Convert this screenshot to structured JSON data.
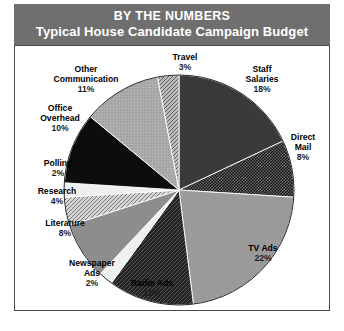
{
  "header": {
    "title_main": "BY THE NUMBERS",
    "title_sub": "Typical House Candidate Campaign Budget",
    "band_color": "#6f6f6f",
    "text_color": "#ffffff"
  },
  "chart_data": {
    "type": "pie",
    "title": "Typical House Candidate Campaign Budget",
    "subtitle": "BY THE NUMBERS",
    "xlabel": "",
    "ylabel": "",
    "legend_position": "none",
    "grid": false,
    "start_angle_deg": 0,
    "direction": "clockwise",
    "unit": "%",
    "categories": [
      "Staff Salaries",
      "Direct Mail",
      "TV Ads",
      "Radio Ads",
      "Newspaper Ads",
      "Literature",
      "Research",
      "Polling",
      "Office Overhead",
      "Other Communication",
      "Travel"
    ],
    "values": [
      18,
      8,
      22,
      12,
      2,
      8,
      4,
      2,
      10,
      11,
      3
    ],
    "slices": [
      {
        "label": "Staff Salaries",
        "label_line1": "Staff",
        "label_line2": "Salaries",
        "value": 18,
        "pct": "18%",
        "fill": "#3a3a3a",
        "pattern": "solid"
      },
      {
        "label": "Direct Mail",
        "label_line1": "Direct",
        "label_line2": "Mail",
        "value": 8,
        "pct": "8%",
        "fill": "#161616",
        "pattern": "checker"
      },
      {
        "label": "TV Ads",
        "label_line1": "TV Ads",
        "label_line2": "",
        "value": 22,
        "pct": "22%",
        "fill": "#9a9a9a",
        "pattern": "solid"
      },
      {
        "label": "Radio Ads",
        "label_line1": "Radio Ads",
        "label_line2": "",
        "value": 12,
        "pct": "12%",
        "fill": "#2b2b2b",
        "pattern": "crosshatch"
      },
      {
        "label": "Newspaper Ads",
        "label_line1": "Newspaper",
        "label_line2": "Ads",
        "value": 2,
        "pct": "2%",
        "fill": "#f0f0f0",
        "pattern": "solid"
      },
      {
        "label": "Literature",
        "label_line1": "Literature",
        "label_line2": "",
        "value": 8,
        "pct": "8%",
        "fill": "#8d8d8d",
        "pattern": "solid"
      },
      {
        "label": "Research",
        "label_line1": "Research",
        "label_line2": "",
        "value": 4,
        "pct": "4%",
        "fill": "#c8c8c8",
        "pattern": "diagonal"
      },
      {
        "label": "Polling",
        "label_line1": "Polling",
        "label_line2": "",
        "value": 2,
        "pct": "2%",
        "fill": "#efefef",
        "pattern": "solid"
      },
      {
        "label": "Office Overhead",
        "label_line1": "Office",
        "label_line2": "Overhead",
        "value": 10,
        "pct": "10%",
        "fill": "#0d0d0d",
        "pattern": "solid"
      },
      {
        "label": "Other Communication",
        "label_line1": "Other",
        "label_line2": "Communication",
        "value": 11,
        "pct": "11%",
        "fill": "#a8a8a8",
        "pattern": "stipple"
      },
      {
        "label": "Travel",
        "label_line1": "Travel",
        "label_line2": "",
        "value": 3,
        "pct": "3%",
        "fill": "#b4b4b4",
        "pattern": "diagonal"
      }
    ]
  }
}
